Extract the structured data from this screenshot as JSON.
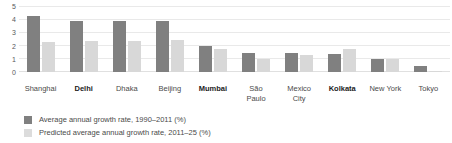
{
  "chart_data": {
    "type": "bar",
    "title": "",
    "subtitle": "",
    "xlabel": "",
    "ylabel": "",
    "ylim": [
      0,
      5
    ],
    "yticks": [
      "5",
      "4",
      "3",
      "2",
      "1",
      "0"
    ],
    "grid": true,
    "legend_position": "bottom-left",
    "categories": [
      "Shanghai",
      "Delhi",
      "Dhaka",
      "Beijing",
      "Mumbai",
      "São\nPaulo",
      "Mexico\nCity",
      "Kolkata",
      "New York",
      "Tokyo"
    ],
    "highlighted_categories": [
      "Delhi",
      "Mumbai",
      "Kolkata"
    ],
    "series": [
      {
        "name": "Average annual growth rate, 1990–2011 (%)",
        "color": "#808080",
        "values": [
          4.3,
          3.9,
          3.9,
          3.9,
          2.0,
          1.5,
          1.5,
          1.4,
          1.0,
          0.5
        ]
      },
      {
        "name": "Predicted average annual growth rate, 2011–25 (%)",
        "color": "#d8d8d8",
        "values": [
          2.3,
          2.4,
          2.4,
          2.5,
          1.8,
          1.0,
          1.3,
          1.8,
          1.0,
          0.1
        ]
      }
    ]
  },
  "legend": {
    "items": [
      {
        "label": "Average annual growth rate, 1990–2011 (%)",
        "swatch": "actual"
      },
      {
        "label": "Predicted average annual growth rate, 2011–25 (%)",
        "swatch": "predict"
      }
    ]
  }
}
